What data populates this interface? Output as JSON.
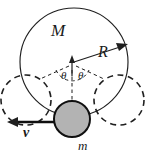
{
  "figure": {
    "type": "physics-diagram",
    "background_color": "#ffffff",
    "stroke_color": "#1f1f1f",
    "labels": {
      "big_mass": "M",
      "radius": "R",
      "small_mass": "m",
      "velocity": "v",
      "angle_left": "θ",
      "angle_right": "θ"
    },
    "shapes": {
      "main_circle": {
        "name": "large-ring",
        "style": "solid",
        "cx": 74,
        "cy": 62,
        "r": 54,
        "label": "M"
      },
      "ball": {
        "name": "small-ball",
        "style": "solid-filled",
        "cx": 72,
        "cy": 119,
        "r": 18,
        "fill": "#b3b3b3",
        "label": "m"
      },
      "dashed_circle_left": {
        "name": "ring-position-left",
        "style": "dashed",
        "cx": 26,
        "cy": 100,
        "r": 25
      },
      "dashed_circle_right": {
        "name": "ring-position-right",
        "style": "dashed",
        "cx": 119,
        "cy": 100,
        "r": 25
      }
    },
    "vectors": {
      "radius_arrow": {
        "name": "radius-vector",
        "from": [
          74,
          62
        ],
        "to": [
          126,
          45
        ],
        "label": "R"
      },
      "velocity_arrow": {
        "name": "velocity-vector",
        "from": [
          56,
          122
        ],
        "to": [
          9,
          122
        ],
        "label": "v",
        "direction": "left"
      },
      "center_up_arrow": {
        "name": "center-up-vector",
        "from": [
          72,
          76
        ],
        "to": [
          72,
          58
        ]
      }
    },
    "angle_marks": {
      "vertex": [
        72,
        63
      ],
      "count": 2,
      "symbol": "θ"
    }
  }
}
